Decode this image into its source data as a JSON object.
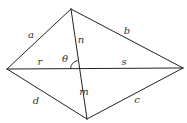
{
  "diagram": {
    "type": "quadrilateral-with-diagonals",
    "vertices": {
      "top": {
        "x": 71,
        "y": 9
      },
      "left": {
        "x": 7,
        "y": 69
      },
      "right": {
        "x": 183,
        "y": 68
      },
      "bottom": {
        "x": 87,
        "y": 119
      }
    },
    "intersection": {
      "x": 78.6,
      "y": 68.6
    },
    "angle_arc_radius": 8,
    "stroke_color": "#222222",
    "labels": {
      "a": {
        "text": "a",
        "x": 31,
        "y": 35
      },
      "b": {
        "text": "b",
        "x": 127,
        "y": 31
      },
      "c": {
        "text": "c",
        "x": 137,
        "y": 100
      },
      "d": {
        "text": "d",
        "x": 36,
        "y": 101
      },
      "r": {
        "text": "r",
        "x": 40,
        "y": 62
      },
      "s": {
        "text": "s",
        "x": 124,
        "y": 62
      },
      "n": {
        "text": "n",
        "x": 81,
        "y": 40
      },
      "m": {
        "text": "m",
        "x": 84,
        "y": 92
      },
      "theta": {
        "text": "θ",
        "x": 65,
        "y": 59
      }
    }
  }
}
